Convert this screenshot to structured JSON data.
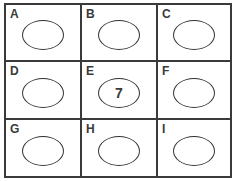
{
  "diagram": {
    "type": "3x3 grid of labeled cells each containing an oval",
    "cells": [
      {
        "label": "A",
        "value": ""
      },
      {
        "label": "B",
        "value": ""
      },
      {
        "label": "C",
        "value": ""
      },
      {
        "label": "D",
        "value": ""
      },
      {
        "label": "E",
        "value": "7"
      },
      {
        "label": "F",
        "value": ""
      },
      {
        "label": "G",
        "value": ""
      },
      {
        "label": "H",
        "value": ""
      },
      {
        "label": "I",
        "value": ""
      }
    ],
    "colors": {
      "line": "#3a3a3a",
      "background": "#ffffff"
    }
  }
}
